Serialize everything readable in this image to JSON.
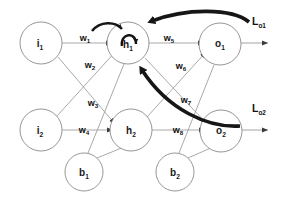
{
  "diagram": {
    "type": "neural-network-graph",
    "colors": {
      "node_stroke": "#8a8a8a",
      "edge": "#9a9a9a",
      "backprop_arrow": "#161616",
      "text": "#111111",
      "background": "#ffffff"
    },
    "nodes": [
      {
        "id": "i1",
        "base": "i",
        "sub": "1",
        "cx": 41,
        "cy": 43,
        "r": 21,
        "layer": "input"
      },
      {
        "id": "i2",
        "base": "i",
        "sub": "2",
        "cx": 41,
        "cy": 130,
        "r": 21,
        "layer": "input"
      },
      {
        "id": "h1",
        "base": "h",
        "sub": "1",
        "cx": 128,
        "cy": 43,
        "r": 21,
        "layer": "hidden"
      },
      {
        "id": "h2",
        "base": "h",
        "sub": "2",
        "cx": 131,
        "cy": 130,
        "r": 21,
        "layer": "hidden"
      },
      {
        "id": "o1",
        "base": "o",
        "sub": "1",
        "cx": 220,
        "cy": 44,
        "r": 21,
        "layer": "output"
      },
      {
        "id": "o2",
        "base": "o",
        "sub": "2",
        "cx": 221,
        "cy": 131,
        "r": 21,
        "layer": "output"
      },
      {
        "id": "b1",
        "base": "b",
        "sub": "1",
        "cx": 84,
        "cy": 172,
        "r": 19,
        "layer": "bias"
      },
      {
        "id": "b2",
        "base": "b",
        "sub": "2",
        "cx": 175,
        "cy": 172,
        "r": 19,
        "layer": "bias"
      }
    ],
    "weights": [
      {
        "id": "w1",
        "base": "w",
        "sub": "1",
        "x": 85,
        "y": 41,
        "from": "i1",
        "to": "h1"
      },
      {
        "id": "w2",
        "base": "w",
        "sub": "2",
        "x": 90,
        "y": 68,
        "from": "i1",
        "to": "h2"
      },
      {
        "id": "w3",
        "base": "w",
        "sub": "3",
        "x": 93,
        "y": 106,
        "from": "i2",
        "to": "h1"
      },
      {
        "id": "w4",
        "base": "w",
        "sub": "4",
        "x": 84,
        "y": 133,
        "from": "i2",
        "to": "h2"
      },
      {
        "id": "w5",
        "base": "w",
        "sub": "5",
        "x": 169,
        "y": 41,
        "from": "h1",
        "to": "o1"
      },
      {
        "id": "w6",
        "base": "w",
        "sub": "6",
        "x": 181,
        "y": 69,
        "from": "h1",
        "to": "o2"
      },
      {
        "id": "w7",
        "base": "w",
        "sub": "7",
        "x": 186,
        "y": 103,
        "from": "h2",
        "to": "o1"
      },
      {
        "id": "w8",
        "base": "w",
        "sub": "8",
        "x": 178,
        "y": 133,
        "from": "h2",
        "to": "o2"
      }
    ],
    "losses": [
      {
        "id": "Lo1",
        "base": "L",
        "sub": "o1",
        "x": 252,
        "y": 25,
        "for": "o1"
      },
      {
        "id": "Lo2",
        "base": "L",
        "sub": "o2",
        "x": 252,
        "y": 112,
        "for": "o2"
      }
    ],
    "bias_edges": [
      {
        "from": "b1",
        "to": "h1"
      },
      {
        "from": "b1",
        "to": "h2"
      },
      {
        "from": "b2",
        "to": "o1"
      },
      {
        "from": "b2",
        "to": "o2"
      }
    ],
    "backprop_arrows": [
      {
        "id": "loss1-to-h1",
        "from": "Lo1",
        "to": "h1",
        "style": "thick-curve"
      },
      {
        "id": "loss2-to-h1",
        "from": "Lo2",
        "to": "h1",
        "style": "thick-curve"
      },
      {
        "id": "h1-self-loop",
        "from": "h1",
        "to": "h1",
        "style": "small-loop"
      },
      {
        "id": "w1-hook",
        "from": "w1",
        "to": "h1",
        "style": "small-loop"
      }
    ]
  }
}
